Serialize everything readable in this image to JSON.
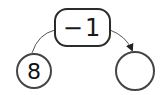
{
  "diagram": {
    "type": "number-operation-flow",
    "operation": {
      "label": "−1"
    },
    "start_node": {
      "value": "8"
    },
    "result_node": {
      "value": ""
    },
    "colors": {
      "stroke": "#2b2b2b",
      "background": "#ffffff",
      "text": "#111111"
    }
  }
}
